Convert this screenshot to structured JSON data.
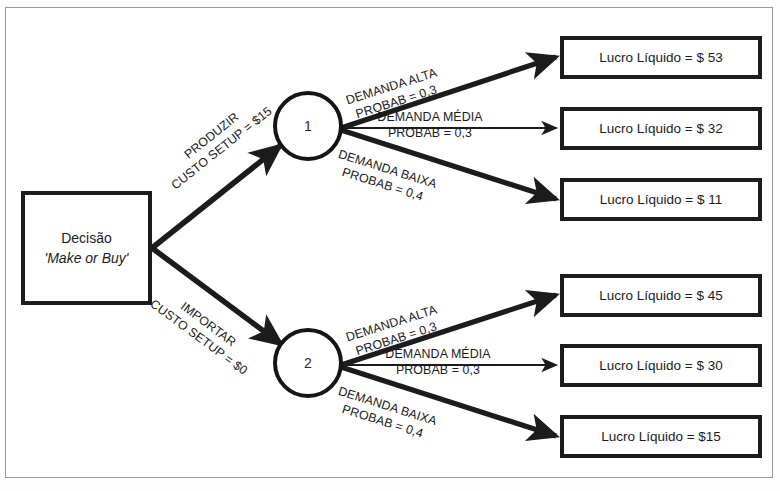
{
  "diagram": {
    "title_present": false,
    "decision_node": {
      "line1": "Decisão",
      "line2": "'Make or Buy'"
    },
    "chance_nodes": [
      {
        "id": "node-1",
        "label": "1"
      },
      {
        "id": "node-2",
        "label": "2"
      }
    ],
    "decision_branches": [
      {
        "name": "produzir",
        "line1": "PRODUZIR",
        "line2": "CUSTO SETUP = $15"
      },
      {
        "name": "importar",
        "line1": "IMPORTAR",
        "line2": "CUSTO SETUP = $0"
      }
    ],
    "branch_labels_top": [
      {
        "name": "alta",
        "line1": "DEMANDA ALTA",
        "line2": "PROBAB = 0,3"
      },
      {
        "name": "media",
        "line1": "DEMANDA MÉDIA",
        "line2": "PROBAB = 0,3"
      },
      {
        "name": "baixa",
        "line1": "DEMANDA BAIXA",
        "line2": "PROBAB = 0,4"
      }
    ],
    "branch_labels_bottom": [
      {
        "name": "alta",
        "line1": "DEMANDA ALTA",
        "line2": "PROBAB = 0,3"
      },
      {
        "name": "media",
        "line1": "DEMANDA MÉDIA",
        "line2": "PROBAB = 0,3"
      },
      {
        "name": "baixa",
        "line1": "DEMANDA BAIXA",
        "line2": "PROBAB = 0,4"
      }
    ],
    "outcomes_top": [
      {
        "name": "outcome-53",
        "text": "Lucro Líquido = $ 53"
      },
      {
        "name": "outcome-32",
        "text": "Lucro Líquido = $ 32"
      },
      {
        "name": "outcome-11",
        "text": "Lucro Líquido = $ 11"
      }
    ],
    "outcomes_bottom": [
      {
        "name": "outcome-45",
        "text": "Lucro Líquido = $ 45"
      },
      {
        "name": "outcome-30",
        "text": "Lucro Líquido = $ 30"
      },
      {
        "name": "outcome-15",
        "text": "Lucro Líquido = $15"
      }
    ],
    "colors": {
      "stroke": "#1c1c1c",
      "frame": "#9a9a9a",
      "background": "#ffffff",
      "text": "#1b1b1b"
    }
  }
}
